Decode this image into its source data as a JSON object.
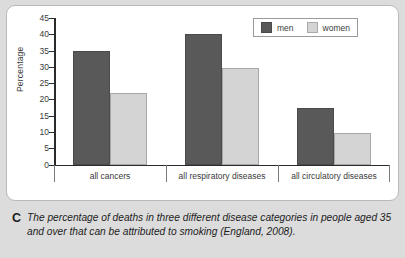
{
  "chart_data": {
    "type": "bar",
    "title": "",
    "xlabel": "",
    "ylabel": "Percentage",
    "ylim": [
      0,
      45
    ],
    "yticks": [
      0,
      5,
      10,
      15,
      20,
      25,
      30,
      35,
      40,
      45
    ],
    "grid": false,
    "legend_position": "top-right",
    "categories": [
      "all cancers",
      "all respiratory diseases",
      "all circulatory diseases"
    ],
    "series": [
      {
        "name": "men",
        "color": "#595959",
        "values": [
          35,
          40,
          17.3
        ]
      },
      {
        "name": "women",
        "color": "#d4d4d4",
        "values": [
          22,
          29.5,
          9.8
        ]
      }
    ]
  },
  "legend": {
    "items": [
      {
        "label": "men"
      },
      {
        "label": "women"
      }
    ]
  },
  "caption": {
    "letter": "C",
    "text": "The percentage of deaths in three different disease categories in people aged 35 and over that can be attributed to smoking (England, 2008)."
  },
  "colors": {
    "men": "#595959",
    "women": "#d4d4d4",
    "axis": "#2b2b2b",
    "panel_background": "#ffffff",
    "caption_background": "#dcdcdc"
  }
}
